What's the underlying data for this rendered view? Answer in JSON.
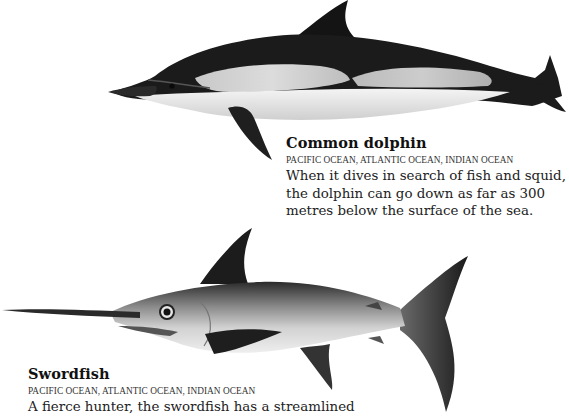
{
  "animals": [
    {
      "name": "Common dolphin",
      "range": "PACIFIC OCEAN, ATLANTIC OCEAN, INDIAN OCEAN",
      "description_lines": [
        "When it dives in search of fish and squid,",
        "the dolphin can go down as far as 300",
        "metres below the surface of the sea."
      ],
      "illustration": "dolphin-illustration"
    },
    {
      "name": "Swordfish",
      "range": "PACIFIC OCEAN, ATLANTIC OCEAN, INDIAN OCEAN",
      "description_lines": [
        "A fierce hunter, the swordfish has a streamlined"
      ],
      "illustration": "swordfish-illustration"
    }
  ]
}
